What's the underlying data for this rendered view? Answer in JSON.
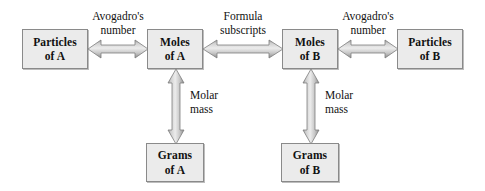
{
  "diagram": {
    "colors": {
      "box_fill": "#ebebeb",
      "box_border": "#8a8a8a",
      "arrow_light": "#e2e2e2",
      "arrow_mid": "#b6b6b6",
      "arrow_dark": "#8d8d8d",
      "background": "#ffffff",
      "text": "#111111"
    },
    "nodes": [
      {
        "id": "particles_a",
        "line1": "Particles",
        "line2": "of A"
      },
      {
        "id": "moles_a",
        "line1": "Moles",
        "line2": "of A"
      },
      {
        "id": "moles_b",
        "line1": "Moles",
        "line2": "of B"
      },
      {
        "id": "particles_b",
        "line1": "Particles",
        "line2": "of B"
      },
      {
        "id": "grams_a",
        "line1": "Grams",
        "line2": "of A"
      },
      {
        "id": "grams_b",
        "line1": "Grams",
        "line2": "of B"
      }
    ],
    "connectors": [
      {
        "id": "particles_a_moles_a",
        "label_line1": "Avogadro's",
        "label_line2": "number",
        "orientation": "horizontal",
        "from": "particles_a",
        "to": "moles_a"
      },
      {
        "id": "moles_a_moles_b",
        "label_line1": "Formula",
        "label_line2": "subscripts",
        "orientation": "horizontal",
        "from": "moles_a",
        "to": "moles_b"
      },
      {
        "id": "moles_b_particles_b",
        "label_line1": "Avogadro's",
        "label_line2": "number",
        "orientation": "horizontal",
        "from": "moles_b",
        "to": "particles_b"
      },
      {
        "id": "moles_a_grams_a",
        "label_line1": "Molar",
        "label_line2": "mass",
        "orientation": "vertical",
        "from": "moles_a",
        "to": "grams_a"
      },
      {
        "id": "moles_b_grams_b",
        "label_line1": "Molar",
        "label_line2": "mass",
        "orientation": "vertical",
        "from": "moles_b",
        "to": "grams_b"
      }
    ]
  }
}
